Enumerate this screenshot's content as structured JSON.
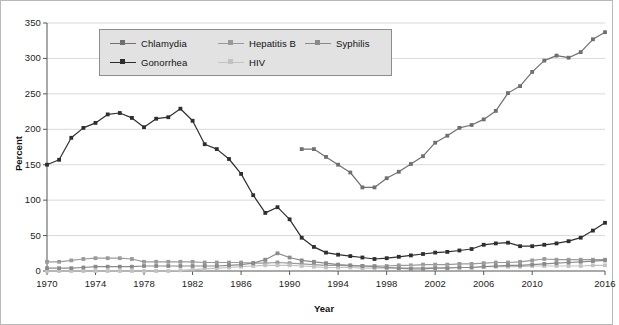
{
  "chart_data": {
    "type": "line",
    "title": "",
    "xlabel": "Year",
    "ylabel": "Percent",
    "xlim": [
      1970,
      2016
    ],
    "ylim": [
      0,
      350
    ],
    "ytick_step": 50,
    "ytick_labels": [
      "0",
      "50",
      "100",
      "150",
      "200",
      "250",
      "300",
      "350"
    ],
    "xtick_labels": [
      "1970",
      "1974",
      "1978",
      "1982",
      "1986",
      "1990",
      "1994",
      "1998",
      "2002",
      "2006",
      "2010",
      "2016"
    ],
    "xticks": [
      1970,
      1974,
      1978,
      1982,
      1986,
      1990,
      1994,
      1998,
      2002,
      2006,
      2010,
      2016
    ],
    "grid": "horizontal",
    "legend_position": "top-left",
    "colors": {
      "chlamydia": "#6f6f6f",
      "gonorrhea": "#2e2e2e",
      "hepatitis_b": "#9a9a9a",
      "hiv": "#c2c2c2",
      "syphilis": "#8a8a8a",
      "grid": "#cfcfcf",
      "axis": "#555555",
      "legend_bg": "#e2e2e2",
      "legend_border": "#8d8d8d",
      "border": "#b9b9b9"
    },
    "series": [
      {
        "name": "Chlamydia",
        "color": "#6f6f6f",
        "x": [
          1991,
          1992,
          1993,
          1994,
          1995,
          1996,
          1997,
          1998,
          1999,
          2000,
          2001,
          2002,
          2003,
          2004,
          2005,
          2006,
          2007,
          2008,
          2009,
          2010,
          2011,
          2012,
          2013,
          2014,
          2015,
          2016
        ],
        "values": [
          172,
          172,
          161,
          150,
          139,
          118,
          118,
          131,
          140,
          151,
          162,
          181,
          191,
          202,
          206,
          214,
          226,
          251,
          261,
          281,
          297,
          304,
          301,
          309,
          327,
          337
        ]
      },
      {
        "name": "Gonorrhea",
        "color": "#2e2e2e",
        "x": [
          1970,
          1971,
          1972,
          1973,
          1974,
          1975,
          1976,
          1977,
          1978,
          1979,
          1980,
          1981,
          1982,
          1983,
          1984,
          1985,
          1986,
          1987,
          1988,
          1989,
          1990,
          1991,
          1992,
          1993,
          1994,
          1995,
          1996,
          1997,
          1998,
          1999,
          2000,
          2001,
          2002,
          2003,
          2004,
          2005,
          2006,
          2007,
          2008,
          2009,
          2010,
          2011,
          2012,
          2013,
          2014,
          2015,
          2016
        ],
        "values": [
          150,
          157,
          188,
          202,
          209,
          221,
          223,
          216,
          203,
          215,
          217,
          229,
          212,
          179,
          172,
          158,
          137,
          107,
          82,
          90,
          73,
          47,
          34,
          26,
          23,
          21,
          19,
          17,
          18,
          20,
          22,
          24,
          26,
          27,
          29,
          31,
          37,
          39,
          40,
          35,
          35,
          37,
          39,
          42,
          47,
          57,
          68
        ]
      },
      {
        "name": "Hepatitis B",
        "color": "#9a9a9a",
        "x": [
          1970,
          1971,
          1972,
          1973,
          1974,
          1975,
          1976,
          1977,
          1978,
          1979,
          1980,
          1981,
          1982,
          1983,
          1984,
          1985,
          1986,
          1987,
          1988,
          1989,
          1990,
          1991,
          1992,
          1993,
          1994,
          1995,
          1996,
          1997,
          1998,
          1999,
          2000,
          2001,
          2002,
          2003,
          2004,
          2005,
          2006,
          2007,
          2008,
          2009,
          2010,
          2011,
          2012,
          2013,
          2014,
          2015,
          2016
        ],
        "values": [
          13,
          13,
          15,
          17,
          18,
          18,
          18,
          17,
          13,
          13,
          13,
          13,
          13,
          12,
          12,
          12,
          12,
          11,
          11,
          12,
          11,
          10,
          9,
          8,
          8,
          7,
          7,
          7,
          7,
          8,
          8,
          9,
          9,
          9,
          10,
          10,
          11,
          12,
          12,
          13,
          15,
          17,
          16,
          16,
          16,
          16,
          16
        ]
      },
      {
        "name": "HIV",
        "color": "#c2c2c2",
        "x": [
          1970,
          1971,
          1972,
          1973,
          1974,
          1975,
          1976,
          1977,
          1978,
          1979,
          1980,
          1981,
          1982,
          1983,
          1984,
          1985,
          1986,
          1987,
          1988,
          1989,
          1990,
          1991,
          1992,
          1993,
          1994,
          1995,
          1996,
          1997,
          1998,
          1999,
          2000,
          2001,
          2002,
          2003,
          2004,
          2005,
          2006,
          2007,
          2008,
          2009,
          2010,
          2011,
          2012,
          2013,
          2014,
          2015,
          2016
        ],
        "values": [
          0,
          0,
          0,
          0,
          0,
          0,
          0,
          0,
          0,
          0,
          0,
          1,
          2,
          3,
          4,
          5,
          6,
          7,
          8,
          8,
          8,
          7,
          6,
          5,
          5,
          5,
          4,
          4,
          4,
          4,
          5,
          5,
          5,
          5,
          5,
          5,
          6,
          6,
          6,
          6,
          7,
          7,
          7,
          7,
          7,
          8,
          8
        ]
      },
      {
        "name": "Syphilis",
        "color": "#8a8a8a",
        "x": [
          1970,
          1971,
          1972,
          1973,
          1974,
          1975,
          1976,
          1977,
          1978,
          1979,
          1980,
          1981,
          1982,
          1983,
          1984,
          1985,
          1986,
          1987,
          1988,
          1989,
          1990,
          1991,
          1992,
          1993,
          1994,
          1995,
          1996,
          1997,
          1998,
          1999,
          2000,
          2001,
          2002,
          2003,
          2004,
          2005,
          2006,
          2007,
          2008,
          2009,
          2010,
          2011,
          2012,
          2013,
          2014,
          2015,
          2016
        ],
        "values": [
          4,
          4,
          4,
          5,
          6,
          6,
          6,
          6,
          7,
          7,
          7,
          7,
          7,
          7,
          7,
          8,
          9,
          11,
          16,
          25,
          19,
          15,
          13,
          11,
          9,
          8,
          7,
          6,
          5,
          4,
          3,
          3,
          4,
          4,
          5,
          5,
          6,
          7,
          8,
          8,
          9,
          10,
          11,
          12,
          13,
          14,
          15
        ]
      }
    ]
  },
  "legend": {
    "items": [
      {
        "label": "Chlamydia"
      },
      {
        "label": "Hepatitis B"
      },
      {
        "label": "Syphilis"
      },
      {
        "label": "Gonorrhea"
      },
      {
        "label": "HIV"
      }
    ]
  },
  "axes": {
    "y_title": "Percent",
    "x_title": "Year"
  }
}
